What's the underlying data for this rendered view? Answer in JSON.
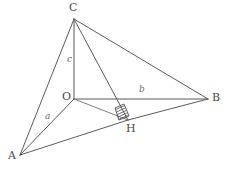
{
  "figure": {
    "kind": "geometry-diagram",
    "width": 234,
    "height": 174,
    "background_color": "#ffffff",
    "stroke_color": "#5b5b5b",
    "label_color": "#4a4a4a",
    "edge_label_color": "#6a6a6a"
  },
  "vertices": [
    {
      "id": "C",
      "label": "C",
      "x": 74,
      "y": 19,
      "label_x": 69,
      "label_y": 2
    },
    {
      "id": "O",
      "label": "O",
      "x": 74,
      "y": 99,
      "label_x": 62,
      "label_y": 91
    },
    {
      "id": "B",
      "label": "B",
      "x": 208,
      "y": 99,
      "label_x": 212,
      "label_y": 92
    },
    {
      "id": "A",
      "label": "A",
      "x": 20,
      "y": 155,
      "label_x": 8,
      "label_y": 150
    },
    {
      "id": "H",
      "label": "H",
      "x": 128,
      "y": 120,
      "label_x": 126,
      "label_y": 123
    }
  ],
  "edges": [
    {
      "id": "CO",
      "from": "C",
      "to": "O"
    },
    {
      "id": "CA",
      "from": "C",
      "to": "A"
    },
    {
      "id": "CB",
      "from": "C",
      "to": "B"
    },
    {
      "id": "CH",
      "from": "C",
      "to": "H"
    },
    {
      "id": "OA",
      "from": "O",
      "to": "A"
    },
    {
      "id": "OB",
      "from": "O",
      "to": "B"
    },
    {
      "id": "OH",
      "from": "O",
      "to": "H"
    },
    {
      "id": "AH",
      "from": "A",
      "to": "H"
    },
    {
      "id": "HB",
      "from": "H",
      "to": "B"
    }
  ],
  "edge_labels": [
    {
      "id": "a",
      "text": "a",
      "edge": "OA",
      "x": 45,
      "y": 112
    },
    {
      "id": "b",
      "text": "b",
      "edge": "OB",
      "x": 139,
      "y": 85
    },
    {
      "id": "c",
      "text": "c",
      "edge": "CO",
      "x": 67,
      "y": 55
    }
  ],
  "markers": [
    {
      "id": "right-angle-hatch",
      "type": "hatched-right-angle",
      "at_vertex": "H",
      "hatch_count": 5,
      "polygon": "119,120 115,108 124,104 129,116"
    }
  ]
}
